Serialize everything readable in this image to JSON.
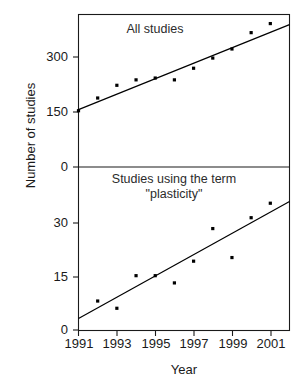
{
  "figure": {
    "axis_title_y": "Number of studies",
    "axis_title_x": "Year",
    "background_color": "#ffffff",
    "ink_color": "#1a1a1a"
  },
  "chart_data": {
    "type": "scatter",
    "title": "",
    "xlabel": "Year",
    "ylabel": "Number of studies",
    "grid": false,
    "legend": "none",
    "x": [
      1991,
      1992,
      1993,
      1994,
      1995,
      1996,
      1997,
      1998,
      1999,
      2000,
      2001
    ],
    "xlim": [
      1991,
      2002
    ],
    "xticks": [
      1991,
      1993,
      1995,
      1997,
      1999,
      2001
    ],
    "xticklabels": [
      "1991",
      "1993",
      "1995",
      "1997",
      "1999",
      "2001"
    ],
    "panels": [
      {
        "name": "all-studies",
        "annotation": "All studies",
        "ylim": [
          0,
          420
        ],
        "yticks": [
          0,
          150,
          300
        ],
        "yticklabels": [
          "0",
          "150",
          "300"
        ],
        "series": [
          {
            "name": "All studies",
            "marker": "square",
            "values": [
              155,
              190,
              225,
              240,
              245,
              240,
              272,
              300,
              325,
              370,
              395
            ]
          }
        ],
        "trendline": {
          "name": "linear fit",
          "x": [
            1991,
            2002
          ],
          "y": [
            158,
            392
          ]
        }
      },
      {
        "name": "plasticity-studies",
        "annotation_line1": "Studies using the term",
        "annotation_line2": "\"plasticity\"",
        "ylim": [
          0,
          45
        ],
        "yticks": [
          0,
          15,
          30
        ],
        "yticklabels": [
          "0",
          "15",
          "30"
        ],
        "series": [
          {
            "name": "Studies using the term \"plasticity\"",
            "marker": "square",
            "values": [
              null,
              8,
              6,
              15,
              15,
              13,
              19,
              28,
              20,
              31,
              35
            ]
          }
        ],
        "trendline": {
          "name": "linear fit",
          "x": [
            1991,
            2002
          ],
          "y": [
            3.2,
            35.5
          ]
        }
      }
    ]
  },
  "ticks": {
    "top_panel": [
      {
        "label": "300",
        "left": 28,
        "top": 49
      },
      {
        "label": "150",
        "left": 28,
        "top": 104
      },
      {
        "label": "0",
        "left": 28,
        "top": 159
      }
    ],
    "bottom_panel": [
      {
        "label": "30",
        "left": 28,
        "top": 215
      },
      {
        "label": "15",
        "left": 28,
        "top": 269
      },
      {
        "label": "0",
        "left": 28,
        "top": 322
      }
    ],
    "x_axis": [
      {
        "label": "1991",
        "left": 57
      },
      {
        "label": "1993",
        "left": 95
      },
      {
        "label": "1995",
        "left": 134
      },
      {
        "label": "1997",
        "left": 172
      },
      {
        "label": "1999",
        "left": 211
      },
      {
        "label": "2001",
        "left": 249
      }
    ]
  }
}
